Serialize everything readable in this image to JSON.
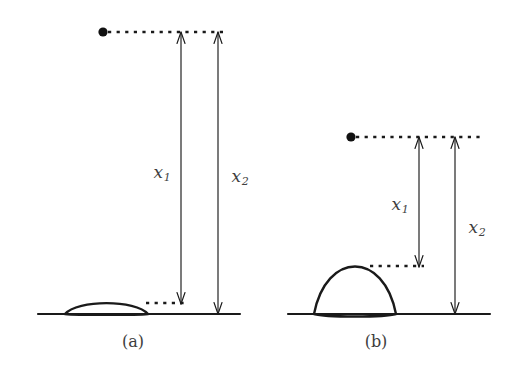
{
  "figure": {
    "width": 514,
    "height": 369,
    "background_color": "#ffffff",
    "ink_color": "#1a1a1a",
    "label_color": "#3f3f3f"
  },
  "panels": [
    {
      "id": "a",
      "caption": "(a)",
      "caption_x": 133,
      "caption_y": 341,
      "description": "flat shallow droplet lens resting on substrate line",
      "ground_line": {
        "x1": 38,
        "x2": 240,
        "y": 314
      },
      "droplet": {
        "left_x": 65,
        "right_x": 148,
        "base_y": 314,
        "apex_y": 303,
        "shape": "flat-lens"
      },
      "source_dot": {
        "cx": 103,
        "cy": 32,
        "r": 4.6
      },
      "top_dashed_line": {
        "x1": 108,
        "x2": 228,
        "y": 32
      },
      "droplet_dashed_line": {
        "x1": 146,
        "x2": 186,
        "y": 303
      },
      "arrows": [
        {
          "name": "x1",
          "label": "x",
          "subscript": "1",
          "label_x": 162,
          "label_y": 172,
          "shaft_x": 181,
          "top_y": 32,
          "bottom_y": 304,
          "double_headed": true
        },
        {
          "name": "x2",
          "label": "x",
          "subscript": "2",
          "label_x": 240,
          "label_y": 176,
          "shaft_x": 218,
          "top_y": 32,
          "bottom_y": 314,
          "double_headed": true
        }
      ]
    },
    {
      "id": "b",
      "caption": "(b)",
      "caption_x": 376,
      "caption_y": 341,
      "description": "tall rounded droplet lens resting on substrate line",
      "ground_line": {
        "x1": 288,
        "x2": 490,
        "y": 314
      },
      "droplet": {
        "left_x": 314,
        "right_x": 396,
        "base_y": 314,
        "apex_y": 266,
        "shape": "round-lens"
      },
      "source_dot": {
        "cx": 351,
        "cy": 137,
        "r": 4.6
      },
      "top_dashed_line": {
        "x1": 356,
        "x2": 480,
        "y": 137
      },
      "droplet_dashed_line": {
        "x1": 370,
        "x2": 424,
        "y": 266
      },
      "arrows": [
        {
          "name": "x1",
          "label": "x",
          "subscript": "1",
          "label_x": 400,
          "label_y": 204,
          "shaft_x": 419,
          "top_y": 137,
          "bottom_y": 267,
          "double_headed": true
        },
        {
          "name": "x2",
          "label": "x",
          "subscript": "2",
          "label_x": 477,
          "label_y": 227,
          "shaft_x": 455,
          "top_y": 137,
          "bottom_y": 314,
          "double_headed": true
        }
      ]
    }
  ]
}
